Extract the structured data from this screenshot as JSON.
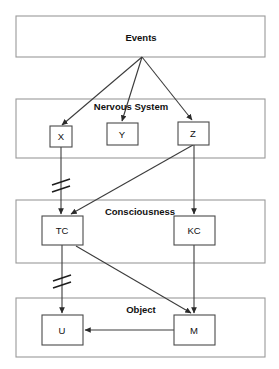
{
  "diagram": {
    "title_caption": "",
    "groups": [
      {
        "id": "events",
        "label": "Events",
        "x": 16,
        "y": 16,
        "w": 249,
        "h": 41,
        "label_x": 141,
        "label_y": 41
      },
      {
        "id": "nervous",
        "label": "Nervous System",
        "x": 16,
        "y": 99,
        "w": 249,
        "h": 59,
        "label_x": 131,
        "label_y": 110
      },
      {
        "id": "consciousness",
        "label": "Consciousness",
        "x": 16,
        "y": 200,
        "w": 249,
        "h": 63,
        "label_x": 140,
        "label_y": 215
      },
      {
        "id": "object",
        "label": "Object",
        "x": 16,
        "y": 298,
        "w": 249,
        "h": 59,
        "label_x": 141,
        "label_y": 313
      }
    ],
    "nodes": [
      {
        "id": "X",
        "label": "X",
        "x": 50,
        "y": 126,
        "w": 22,
        "h": 21,
        "label_x": 61,
        "label_y": 140
      },
      {
        "id": "Y",
        "label": "Y",
        "x": 107,
        "y": 123,
        "w": 31,
        "h": 22,
        "label_x": 122,
        "label_y": 138
      },
      {
        "id": "Z",
        "label": "Z",
        "x": 178,
        "y": 122,
        "w": 31,
        "h": 23,
        "label_x": 193,
        "label_y": 137
      },
      {
        "id": "TC",
        "label": "TC",
        "x": 42,
        "y": 216,
        "w": 41,
        "h": 29,
        "label_x": 62,
        "label_y": 234
      },
      {
        "id": "KC",
        "label": "KC",
        "x": 174,
        "y": 216,
        "w": 41,
        "h": 29,
        "label_x": 194,
        "label_y": 234
      },
      {
        "id": "U",
        "label": "U",
        "x": 42,
        "y": 315,
        "w": 41,
        "h": 30,
        "label_x": 62,
        "label_y": 334
      },
      {
        "id": "M",
        "label": "M",
        "x": 174,
        "y": 315,
        "w": 41,
        "h": 30,
        "label_x": 194,
        "label_y": 334
      }
    ],
    "edges": [
      {
        "id": "events-to-x",
        "from": "Events",
        "to": "X",
        "points": "142,57 62,125"
      },
      {
        "id": "events-to-y",
        "from": "Events",
        "to": "Y",
        "points": "142,57 122,121"
      },
      {
        "id": "events-to-z",
        "from": "Events",
        "to": "Z",
        "points": "142,57 192,120"
      },
      {
        "id": "x-to-tc",
        "from": "X",
        "to": "TC",
        "points": "61,147 61,214"
      },
      {
        "id": "z-to-tc",
        "from": "Z",
        "to": "TC",
        "points": "193,145 71,214"
      },
      {
        "id": "z-to-kc",
        "from": "Z",
        "to": "KC",
        "points": "194,145 194,214"
      },
      {
        "id": "tc-to-u",
        "from": "TC",
        "to": "U",
        "points": "62,245 62,313"
      },
      {
        "id": "tc-to-m",
        "from": "TC",
        "to": "M",
        "points": "76,246 191,313"
      },
      {
        "id": "kc-to-m",
        "from": "KC",
        "to": "M",
        "points": "194,245 194,313"
      },
      {
        "id": "m-to-u",
        "from": "M",
        "to": "U",
        "points": "174,330 85,330"
      }
    ],
    "break_marks": [
      {
        "id": "break-x-tc",
        "x": 61,
        "y": 183
      },
      {
        "id": "break-tc-u",
        "x": 62,
        "y": 279
      }
    ]
  }
}
